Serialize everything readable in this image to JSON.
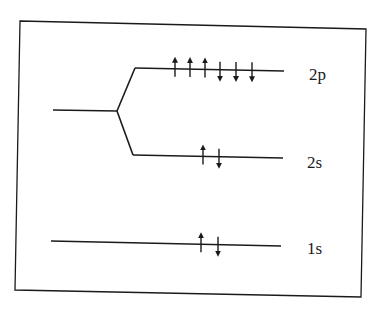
{
  "diagram": {
    "type": "energy-level-diagram",
    "colors": {
      "line": "#1a1a1a",
      "background": "#ffffff"
    },
    "frame": {
      "points": [
        [
          20,
          21
        ],
        [
          366,
          29
        ],
        [
          361,
          297
        ],
        [
          15,
          290
        ]
      ]
    },
    "levels": [
      {
        "id": "2p",
        "label": "2p",
        "line": [
          [
            135,
            68
          ],
          [
            284,
            71
          ]
        ],
        "label_pos": [
          309,
          80
        ],
        "arrows": [
          {
            "dir": "up",
            "x": 175
          },
          {
            "dir": "up",
            "x": 190
          },
          {
            "dir": "up",
            "x": 205
          },
          {
            "dir": "down",
            "x": 220
          },
          {
            "dir": "down",
            "x": 236
          },
          {
            "dir": "down",
            "x": 252
          }
        ]
      },
      {
        "id": "2s",
        "label": "2s",
        "line": [
          [
            133,
            155
          ],
          [
            283,
            158
          ]
        ],
        "label_pos": [
          307,
          168
        ],
        "arrows": [
          {
            "dir": "up",
            "x": 203
          },
          {
            "dir": "down",
            "x": 219
          }
        ]
      },
      {
        "id": "1s",
        "label": "1s",
        "line": [
          [
            51,
            241
          ],
          [
            281,
            246
          ]
        ],
        "label_pos": [
          307,
          254
        ],
        "arrows": [
          {
            "dir": "up",
            "x": 201
          },
          {
            "dir": "down",
            "x": 218
          }
        ]
      }
    ],
    "splitting": {
      "stem": [
        [
          53,
          110
        ],
        [
          117,
          111
        ]
      ],
      "branch_up": [
        [
          117,
          111
        ],
        [
          135,
          68
        ]
      ],
      "branch_down": [
        [
          117,
          111
        ],
        [
          133,
          155
        ]
      ]
    },
    "electron_count": {
      "1s": 2,
      "2s": 2,
      "2p": 6
    }
  }
}
